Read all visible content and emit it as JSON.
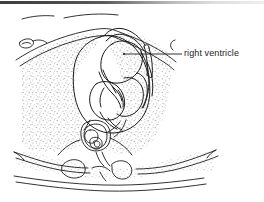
{
  "figure": {
    "kind": "anatomical-line-drawing",
    "width": 264,
    "height": 202,
    "background_color": "#ffffff",
    "ink_color": "#1b1b1b",
    "stipple_color": "#8f8f8f",
    "top_bar_color": "#3d3d3d"
  },
  "annotations": [
    {
      "id": "right-ventricle",
      "label": "right ventricle",
      "leader_from": [
        124,
        54
      ],
      "leader_to": [
        182,
        54
      ],
      "label_position": [
        184,
        48
      ]
    }
  ],
  "structures": [
    {
      "name": "chest-wall-outline"
    },
    {
      "name": "skin-surface-line"
    },
    {
      "name": "rib-anterior-left"
    },
    {
      "name": "rib-posterior-left"
    },
    {
      "name": "rib-posterior-right"
    },
    {
      "name": "lung-field-left"
    },
    {
      "name": "lung-field-right"
    },
    {
      "name": "heart-outline"
    },
    {
      "name": "right-ventricle-chamber"
    },
    {
      "name": "left-ventricle-chamber"
    },
    {
      "name": "interventricular-septum"
    },
    {
      "name": "right-atrium-chamber"
    },
    {
      "name": "left-atrium-chamber"
    },
    {
      "name": "descending-aorta"
    },
    {
      "name": "vertebral-body"
    },
    {
      "name": "spinal-canal"
    },
    {
      "name": "spinous-process"
    }
  ]
}
